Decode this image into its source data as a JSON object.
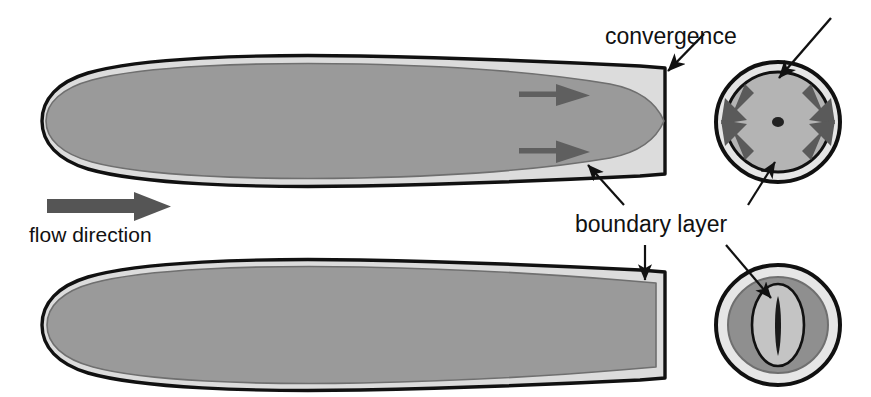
{
  "figure": {
    "type": "scientific-diagram",
    "background_color": "#ffffff"
  },
  "colors": {
    "outline": "#111111",
    "boundary_layer_fill": "#dcdcdc",
    "body_fill": "#9a9a9a",
    "body_fill_dark": "#8f8f8f",
    "arrow_gray": "#666666",
    "flow_arrow_gray": "#555555",
    "circle_outer_ring": "#111111",
    "circle_light_ring": "#e2e2e2",
    "circle_mid_ring": "#8f8f8f",
    "circle_inner_fill": "#b4b4b4",
    "center_dot": "#222222",
    "slit": "#1a1a1a"
  },
  "labels": {
    "convergence": "convergence",
    "boundary_layer": "boundary layer",
    "flow_direction": "flow direction"
  },
  "icons": {
    "flow_arrow": "right-arrow-icon",
    "convergence_arrow": "inward-arrow-icon",
    "leader_arrow": "leader-arrow-icon"
  },
  "panels": {
    "top_body": {
      "name": "streamlined-body-profile-top",
      "description": "Side profile of a sharply tapered body with a thickening boundary layer toward the tail",
      "nose_x": 42,
      "tail_x": 665,
      "center_y": 121,
      "max_half_height": 55,
      "boundary_layer_arrows": 2
    },
    "bottom_body": {
      "name": "streamlined-body-profile-bottom",
      "description": "Side profile of a blunt-tailed body with a thin uniform boundary layer",
      "nose_x": 42,
      "tail_x": 665,
      "center_y": 325,
      "max_half_height": 55,
      "boundary_layer_arrows": 0
    },
    "top_section": {
      "name": "cross-section-top",
      "description": "Rear cross-section showing boundary layer fluid converging radially onto the axis",
      "center_x": 778,
      "center_y": 122,
      "radius_x": 62,
      "radius_y": 60,
      "convergence_arrows": 4,
      "has_center_dot": true
    },
    "bottom_section": {
      "name": "cross-section-bottom",
      "description": "Rear cross-section showing a thick annular boundary layer and a narrow slit core",
      "center_x": 778,
      "center_y": 325,
      "radius_x": 62,
      "radius_y": 60,
      "has_center_dot": false,
      "has_slit": true
    }
  },
  "annotations": [
    {
      "id": "convergence-to-tail",
      "label_ref": "convergence",
      "points_to": "top-body-tail-corner"
    },
    {
      "id": "convergence-to-section",
      "label_ref": "convergence",
      "points_to": "top-cross-section-top-edge"
    },
    {
      "id": "boundary-layer-to-top-body",
      "label_ref": "boundary_layer",
      "points_to": "top-body-lower-boundary-layer"
    },
    {
      "id": "boundary-layer-to-top-section",
      "label_ref": "boundary_layer",
      "points_to": "top-cross-section-lower-ring"
    },
    {
      "id": "boundary-layer-to-bottom-body",
      "label_ref": "boundary_layer",
      "points_to": "bottom-body-upper-boundary-layer"
    },
    {
      "id": "boundary-layer-to-bottom-section",
      "label_ref": "boundary_layer",
      "points_to": "bottom-cross-section-core"
    }
  ]
}
